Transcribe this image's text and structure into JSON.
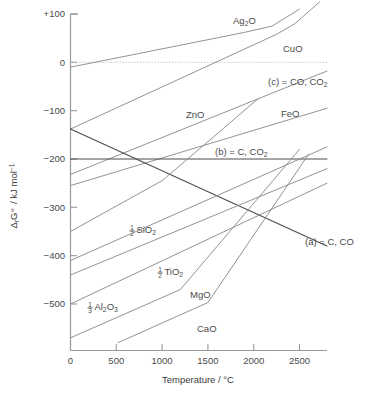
{
  "chart_data": {
    "type": "line",
    "title": "",
    "xlabel": "Temperature / °C",
    "ylabel": "ΔrG⦵ / kJ mol⁻¹",
    "xlim": [
      0,
      2800
    ],
    "ylim": [
      -580,
      100
    ],
    "xticks": [
      0,
      500,
      1000,
      1500,
      2000,
      2500
    ],
    "xticklabels": [
      "0",
      "500",
      "1000",
      "1500",
      "2000",
      "2500"
    ],
    "yticks": [
      100,
      0,
      -100,
      -200,
      -300,
      -400,
      -500
    ],
    "yticklabels": [
      "+100",
      "0",
      "−100",
      "−200",
      "−300",
      "−400",
      "−500"
    ],
    "grid": false,
    "legend_position": "inline-labels",
    "zero_reference_line": {
      "value": 0,
      "style": "dotted",
      "color": "#b4b4b4"
    },
    "series": [
      {
        "name": "Ag2O",
        "label": "Ag",
        "label_sub": "2",
        "label_tail": "O",
        "label_x": 233,
        "label_y": 24,
        "color": "#8c8c8c",
        "emphasis": "normal",
        "points": [
          [
            0,
            -10
          ],
          [
            1900,
            62
          ],
          [
            2200,
            75
          ],
          [
            2500,
            110
          ]
        ]
      },
      {
        "name": "CuO",
        "label": "CuO",
        "label_x": 283,
        "label_y": 52,
        "color": "#8c8c8c",
        "emphasis": "normal",
        "points": [
          [
            0,
            -138
          ],
          [
            2250,
            58
          ],
          [
            2450,
            80
          ],
          [
            2720,
            125
          ]
        ]
      },
      {
        "name": "c_CO_CO2",
        "label": "(c) = CO, CO",
        "label_sub": "2",
        "label_x": 268,
        "label_y": 85,
        "color": "#8c8c8c",
        "emphasis": "normal",
        "points": [
          [
            0,
            -232
          ],
          [
            2800,
            -18
          ]
        ]
      },
      {
        "name": "FeO",
        "label": "FeO",
        "label_x": 281,
        "label_y": 117,
        "color": "#8c8c8c",
        "emphasis": "normal",
        "points": [
          [
            0,
            -255
          ],
          [
            2800,
            -95
          ]
        ]
      },
      {
        "name": "b_C_CO2",
        "label": "(b) = C, CO",
        "label_sub": "2",
        "label_x": 215,
        "label_y": 155,
        "color": "#4c4c4c",
        "emphasis": "dark",
        "points": [
          [
            0,
            -200
          ],
          [
            2800,
            -200
          ]
        ]
      },
      {
        "name": "a_C_CO",
        "label": "(a) = C, CO",
        "label_sub": "",
        "label_x": 305,
        "label_y": 245,
        "color": "#4c4c4c",
        "emphasis": "dark",
        "points": [
          [
            0,
            -138
          ],
          [
            2800,
            -380
          ]
        ]
      },
      {
        "name": "ZnO",
        "label": "ZnO",
        "label_x": 186,
        "label_y": 118,
        "color": "#8c8c8c",
        "emphasis": "normal",
        "points": [
          [
            0,
            -350
          ],
          [
            950,
            -250
          ],
          [
            1000,
            -245
          ],
          [
            2050,
            -75
          ]
        ]
      },
      {
        "name": "SiO2_half",
        "label": "SiO",
        "label_frac_num": "1",
        "label_frac_den": "2",
        "label_sub": "2",
        "label_x": 132,
        "label_y": 233,
        "color": "#8c8c8c",
        "emphasis": "normal",
        "points": [
          [
            0,
            -410
          ],
          [
            2800,
            -175
          ]
        ]
      },
      {
        "name": "TiO2_half",
        "label": "TiO",
        "label_frac_num": "1",
        "label_frac_den": "2",
        "label_sub": "2",
        "label_x": 160,
        "label_y": 275,
        "color": "#8c8c8c",
        "emphasis": "normal",
        "points": [
          [
            0,
            -440
          ],
          [
            2800,
            -220
          ]
        ]
      },
      {
        "name": "Al2O3_third",
        "label": "Al",
        "label_frac_num": "1",
        "label_frac_den": "3",
        "label_sub": "2",
        "label_mid": "O",
        "label_sub2": "3",
        "label_x": 90,
        "label_y": 310,
        "color": "#8c8c8c",
        "emphasis": "normal",
        "points": [
          [
            0,
            -500
          ],
          [
            2800,
            -250
          ]
        ]
      },
      {
        "name": "MgO",
        "label": "MgO",
        "label_x": 190,
        "label_y": 298,
        "color": "#8c8c8c",
        "emphasis": "normal",
        "points": [
          [
            0,
            -570
          ],
          [
            1200,
            -470
          ],
          [
            2500,
            -180
          ]
        ]
      },
      {
        "name": "CaO",
        "label": "CaO",
        "label_x": 197,
        "label_y": 332,
        "color": "#8c8c8c",
        "emphasis": "normal",
        "points": [
          [
            520,
            -580
          ],
          [
            1500,
            -497
          ],
          [
            2600,
            -190
          ]
        ]
      }
    ]
  },
  "axes": {
    "x_title": "Temperature / °C",
    "y_title_delta": "Δ",
    "y_title_sub_r": "r",
    "y_title_G": "G",
    "y_title_standard": "⦵",
    "y_title_units": " / kJ mol",
    "y_title_exp": "−1"
  }
}
